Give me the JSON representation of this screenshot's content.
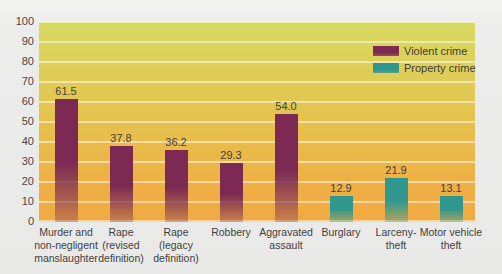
{
  "chart_data": {
    "type": "bar",
    "title": "",
    "xlabel": "",
    "ylabel": "",
    "grid": "horizontal",
    "legend_position": "top-right",
    "y_axis": {
      "min": 0,
      "max": 100,
      "step": 10,
      "ticks": [
        "100",
        "90",
        "80",
        "70",
        "60",
        "50",
        "40",
        "30",
        "20",
        "10",
        "0"
      ]
    },
    "categories": [
      {
        "label": "Murder and\nnon-negligent\nmanslaughter",
        "value": 61.5,
        "value_display": "61.5",
        "series": "violent"
      },
      {
        "label": "Rape\n(revised\ndefinition)",
        "value": 37.8,
        "value_display": "37.8",
        "series": "violent"
      },
      {
        "label": "Rape\n(legacy\ndefinition)",
        "value": 36.2,
        "value_display": "36.2",
        "series": "violent"
      },
      {
        "label": "Robbery",
        "value": 29.3,
        "value_display": "29.3",
        "series": "violent"
      },
      {
        "label": "Aggravated\nassault",
        "value": 54.0,
        "value_display": "54.0",
        "series": "violent"
      },
      {
        "label": "Burglary",
        "value": 12.9,
        "value_display": "12.9",
        "series": "property"
      },
      {
        "label": "Larceny-\ntheft",
        "value": 21.9,
        "value_display": "21.9",
        "series": "property"
      },
      {
        "label": "Motor vehicle\ntheft",
        "value": 13.1,
        "value_display": "13.1",
        "series": "property"
      }
    ],
    "legend": [
      {
        "label": "Violent crime",
        "series": "violent",
        "color": "#7c2a53"
      },
      {
        "label": "Property crime",
        "series": "property",
        "color": "#2f978e"
      }
    ],
    "colors": {
      "violent_bar": "#7c2a53",
      "property_bar": "#2f978e",
      "plot_bg_top": "#d7da62",
      "plot_bg_mid": "#e5c24d",
      "plot_bg_bottom": "#f1a942",
      "gridline": "rgba(255,255,255,0.5)",
      "text": "#3f3f3f"
    }
  }
}
